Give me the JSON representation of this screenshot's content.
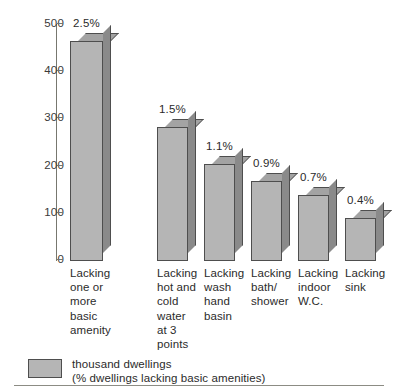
{
  "chart_data": {
    "type": "bar",
    "title": "",
    "xlabel": "",
    "ylabel": "",
    "ylim": [
      0,
      500
    ],
    "yticks": [
      0,
      100,
      200,
      300,
      400,
      500
    ],
    "grid": false,
    "legend_position": "bottom-left",
    "units": "thousand dwellings",
    "categories": [
      "Lacking\none or\nmore\nbasic\namenity",
      "Lacking\nhot and\ncold\nwater\nat 3\npoints",
      "Lacking\nwash\nhand\nbasin",
      "Lacking\nbath/\nshower",
      "Lacking\nindoor\nW.C.",
      "Lacking\nsink"
    ],
    "values": [
      465,
      282,
      205,
      168,
      140,
      90
    ],
    "data_labels": [
      "2.5%",
      "1.5%",
      "1.1%",
      "0.9%",
      "0.7%",
      "0.4%"
    ],
    "series": [
      {
        "name": "thousand dwellings",
        "values": [
          465,
          282,
          205,
          168,
          140,
          90
        ]
      }
    ],
    "legend": [
      {
        "label": "thousand dwellings\n(% dwellings lacking basic amenities)",
        "color": "#b5b5b5"
      }
    ]
  },
  "axis": {
    "tick_labels": [
      "500",
      "400",
      "300",
      "200",
      "100",
      "0"
    ]
  },
  "legend": {
    "text": "thousand dwellings\n(% dwellings lacking basic amenities)"
  },
  "colors": {
    "bar_front": "#b5b5b5",
    "bar_top": "#a3a3a3",
    "bar_side": "#8a8a8a",
    "bar_outline": "#4e4e4e",
    "axis": "#77776f",
    "rule": "#8c8c84",
    "text": "#2b2b2b"
  }
}
